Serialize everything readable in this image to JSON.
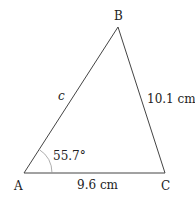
{
  "diagram": {
    "type": "triangle",
    "vertices": {
      "A": {
        "label": "A",
        "x": 24,
        "y": 173
      },
      "B": {
        "label": "B",
        "x": 118,
        "y": 27
      },
      "C": {
        "label": "C",
        "x": 165,
        "y": 173
      }
    },
    "sides": {
      "AB": {
        "label": "c"
      },
      "BC": {
        "label": "10.1 cm"
      },
      "AC": {
        "label": "9.6 cm"
      }
    },
    "angle_A": {
      "label": "55.7°",
      "arc_radius": 28
    },
    "colors": {
      "stroke": "#444444",
      "arc": "#999999",
      "text": "#222222"
    }
  }
}
